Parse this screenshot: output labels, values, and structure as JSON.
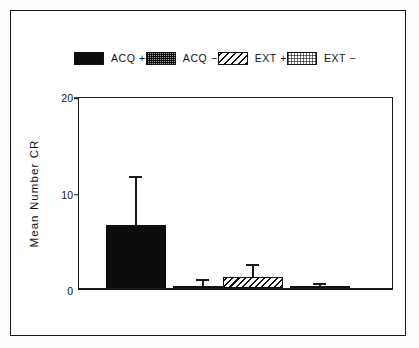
{
  "chart_data": {
    "type": "bar",
    "title": "",
    "xlabel": "",
    "ylabel": "Mean Number  CR",
    "ylim": [
      0,
      20
    ],
    "yticks": [
      0,
      10,
      20
    ],
    "ytick_labels": [
      "0",
      "10",
      "20"
    ],
    "grid": false,
    "legend_position": "top",
    "categories": [
      "ACQ +",
      "ACQ −",
      "EXT +",
      "EXT −"
    ],
    "values": [
      6.5,
      0.2,
      1.1,
      0.05
    ],
    "errors": [
      4.9,
      0.5,
      1.2,
      0.25
    ],
    "bars": [
      {
        "label": "ACQ +",
        "value": 6.5,
        "error_high": 11.4,
        "error": 4.9,
        "fill": "solid"
      },
      {
        "label": "ACQ −",
        "value": 0.2,
        "error_high": 0.7,
        "error": 0.5,
        "fill": "stipple"
      },
      {
        "label": "EXT +",
        "value": 1.1,
        "error_high": 2.3,
        "error": 1.2,
        "fill": "hatch"
      },
      {
        "label": "EXT −",
        "value": 0.05,
        "error_high": 0.3,
        "error": 0.25,
        "fill": "dots"
      }
    ],
    "legend": [
      {
        "label": "ACQ +",
        "fill": "solid"
      },
      {
        "label": "ACQ −",
        "fill": "stipple"
      },
      {
        "label": "EXT +",
        "fill": "hatch"
      },
      {
        "label": "EXT −",
        "fill": "dots"
      }
    ]
  },
  "axis": {
    "y_title": "Mean Number  CR",
    "tick_20": "20",
    "tick_10": "10",
    "tick_0": "0"
  },
  "legend": {
    "items": [
      {
        "label": "ACQ +"
      },
      {
        "label": "ACQ −"
      },
      {
        "label": "EXT +"
      },
      {
        "label": "EXT −"
      }
    ]
  },
  "colors": {
    "ink": "#1b1b1b",
    "paper": "#ffffff",
    "bar_solid": "#0d0d0d",
    "bar_stipple": "#9a9a9a"
  }
}
